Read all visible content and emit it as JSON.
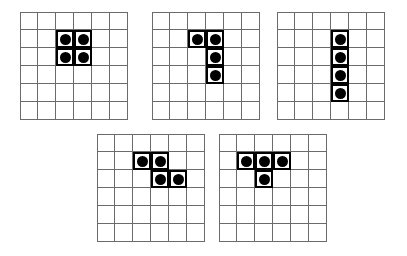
{
  "page": {
    "background_color": "#ffffff",
    "width": 407,
    "height": 256
  },
  "style": {
    "grid_line_color": "#6b6b6b",
    "piece_border_color": "#000000",
    "dot_color": "#000000",
    "cell_background": "#ffffff",
    "cell_size_px": 18,
    "grid_rows": 6,
    "grid_cols": 6
  },
  "boards": [
    {
      "name": "board-1",
      "shape_label": "O-tetromino",
      "position": {
        "x": 20,
        "y": 12
      },
      "rows": 6,
      "cols": 6,
      "filled_cells": [
        {
          "row": 2,
          "col": 3
        },
        {
          "row": 2,
          "col": 4
        },
        {
          "row": 3,
          "col": 3
        },
        {
          "row": 3,
          "col": 4
        }
      ]
    },
    {
      "name": "board-2",
      "shape_label": "J-tetromino",
      "position": {
        "x": 152,
        "y": 12
      },
      "rows": 6,
      "cols": 6,
      "filled_cells": [
        {
          "row": 2,
          "col": 3
        },
        {
          "row": 2,
          "col": 4
        },
        {
          "row": 3,
          "col": 4
        },
        {
          "row": 4,
          "col": 4
        }
      ]
    },
    {
      "name": "board-3",
      "shape_label": "I-tetromino",
      "position": {
        "x": 277,
        "y": 12
      },
      "rows": 6,
      "cols": 6,
      "filled_cells": [
        {
          "row": 2,
          "col": 4
        },
        {
          "row": 3,
          "col": 4
        },
        {
          "row": 4,
          "col": 4
        },
        {
          "row": 5,
          "col": 4
        }
      ]
    },
    {
      "name": "board-4",
      "shape_label": "S-tetromino",
      "position": {
        "x": 97,
        "y": 134
      },
      "rows": 6,
      "cols": 6,
      "filled_cells": [
        {
          "row": 2,
          "col": 3
        },
        {
          "row": 2,
          "col": 4
        },
        {
          "row": 3,
          "col": 4
        },
        {
          "row": 3,
          "col": 5
        }
      ]
    },
    {
      "name": "board-5",
      "shape_label": "T-tetromino",
      "position": {
        "x": 219,
        "y": 134
      },
      "rows": 6,
      "cols": 6,
      "filled_cells": [
        {
          "row": 2,
          "col": 2
        },
        {
          "row": 2,
          "col": 3
        },
        {
          "row": 2,
          "col": 4
        },
        {
          "row": 3,
          "col": 3
        }
      ]
    }
  ]
}
